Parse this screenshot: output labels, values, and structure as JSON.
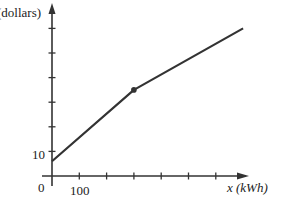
{
  "chart_data": {
    "type": "line",
    "title": "",
    "xlabel": "x (kWh)",
    "ylabel": "(dollars)",
    "x_tick_labels": [
      "0",
      "100"
    ],
    "y_tick_labels": [
      "10"
    ],
    "x_ticks": [
      100,
      200,
      300,
      400,
      500,
      600
    ],
    "y_ticks": [
      10,
      20,
      30,
      40,
      50,
      60
    ],
    "xlim": [
      0,
      720
    ],
    "ylim": [
      0,
      67
    ],
    "grid": false,
    "legend": null,
    "series": [
      {
        "name": "cost",
        "x": [
          0,
          300,
          700
        ],
        "y": [
          6,
          35,
          60
        ],
        "marked_points": [
          {
            "x": 300,
            "y": 35
          }
        ]
      }
    ],
    "origin_label": "0",
    "color": "#333333"
  },
  "labels": {
    "y_axis": "(dollars)",
    "x_axis": "x (kWh)",
    "origin": "0",
    "x_tick_100": "100",
    "y_tick_10": "10"
  }
}
